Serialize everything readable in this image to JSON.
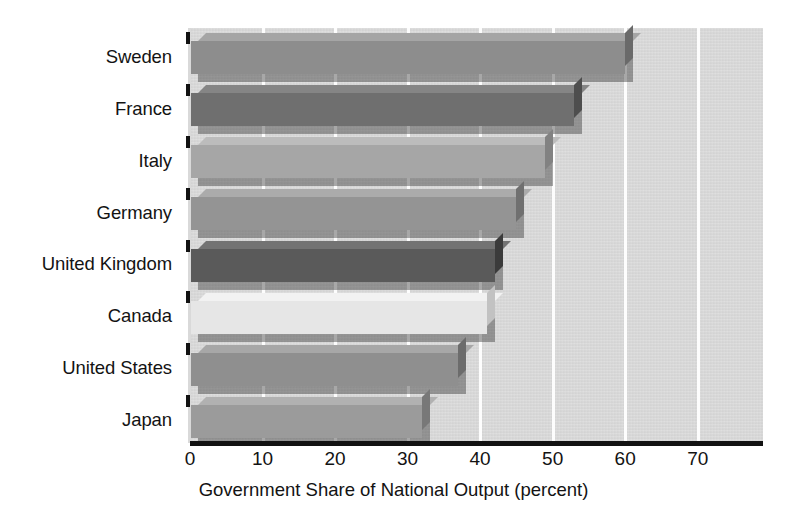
{
  "chart_data": {
    "type": "bar",
    "orientation": "horizontal",
    "title": "",
    "xlabel": "Government Share of National Output (percent)",
    "ylabel": "",
    "categories": [
      "Sweden",
      "France",
      "Italy",
      "Germany",
      "United Kingdom",
      "Canada",
      "United States",
      "Japan"
    ],
    "values": [
      60,
      53,
      49,
      45,
      42,
      41,
      37,
      32
    ],
    "xlim": [
      0,
      79
    ],
    "xticks": [
      0,
      10,
      20,
      30,
      40,
      50,
      60,
      70
    ],
    "xticklabels": [
      "0",
      "10",
      "20",
      "30",
      "40",
      "50",
      "60",
      "70"
    ],
    "grid": true,
    "grid_color": "#fdfdfd",
    "legend": false,
    "plot_background": "#d9d9d9",
    "bar_colors": [
      "#8d8d8d",
      "#6f6f6f",
      "#a6a6a6",
      "#949494",
      "#5a5a5a",
      "#e6e6e6",
      "#8f8f8f",
      "#9b9b9b"
    ],
    "bar_top_colors": [
      "#a5a5a5",
      "#858585",
      "#bcbcbc",
      "#ababab",
      "#737373",
      "#f2f2f2",
      "#a7a7a7",
      "#b1b1b1"
    ],
    "bar_side_colors": [
      "#6a6a6a",
      "#4e4e4e",
      "#828282",
      "#707070",
      "#3b3b3b",
      "#c2c2c2",
      "#6c6c6c",
      "#787878"
    ],
    "series": [
      {
        "name": "Government Share of National Output",
        "points": [
          {
            "category": "Sweden",
            "value": 60
          },
          {
            "category": "France",
            "value": 53
          },
          {
            "category": "Italy",
            "value": 49
          },
          {
            "category": "Germany",
            "value": 45
          },
          {
            "category": "United Kingdom",
            "value": 42
          },
          {
            "category": "Canada",
            "value": 41
          },
          {
            "category": "United States",
            "value": 37
          },
          {
            "category": "Japan",
            "value": 32
          }
        ]
      }
    ]
  }
}
